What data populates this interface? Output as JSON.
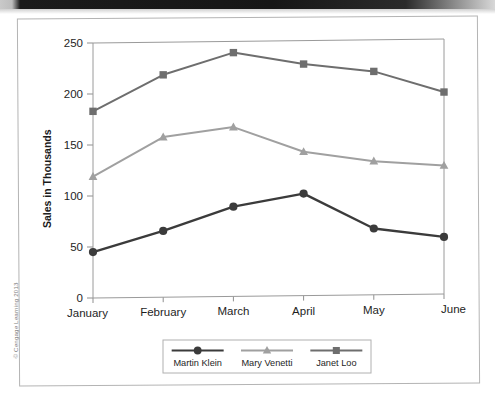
{
  "page": {
    "copyright": "© Cengage Learning 2013"
  },
  "chart_data": {
    "type": "line",
    "title": "",
    "xlabel": "",
    "ylabel": "Sales in Thousands",
    "categories": [
      "January",
      "February",
      "March",
      "April",
      "May",
      "June"
    ],
    "ylim": [
      0,
      250
    ],
    "yticks": [
      0,
      50,
      100,
      150,
      200,
      250
    ],
    "ytick_labels": [
      "0",
      "50",
      "100",
      "150",
      "200",
      "250"
    ],
    "grid": false,
    "legend_position": "bottom",
    "series": [
      {
        "name": "Martin Klein",
        "marker": "circle",
        "color": "#3b3b3b",
        "values": [
          45,
          65,
          88,
          100,
          65,
          56
        ]
      },
      {
        "name": "Mary Venetti",
        "marker": "triangle",
        "color": "#a0a0a0",
        "values": [
          119,
          157,
          166,
          141,
          131,
          126
        ]
      },
      {
        "name": "Janet Loo",
        "marker": "square",
        "color": "#6e6e6e",
        "values": [
          183,
          218,
          239,
          227,
          219,
          198
        ]
      }
    ]
  }
}
